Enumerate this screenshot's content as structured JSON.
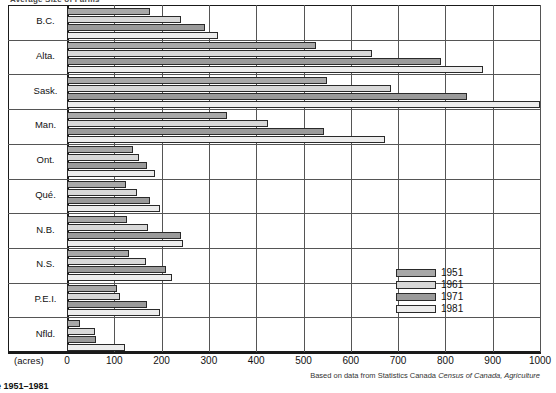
{
  "title": "Average Size of Farms",
  "bottom_caption": "e 1951–1981",
  "source_note_prefix": "Based on data from Statistics Canada ",
  "source_note_italic": "Census of Canada, Agriculture",
  "x_units_label": "(acres)",
  "legend": {
    "items": [
      {
        "label": "1951",
        "color": "#a8a8a8"
      },
      {
        "label": "1961",
        "color": "#d8d8d8"
      },
      {
        "label": "1971",
        "color": "#9a9a9a"
      },
      {
        "label": "1981",
        "color": "#ececec"
      }
    ]
  },
  "chart_data": {
    "type": "bar",
    "orientation": "horizontal",
    "title": "Average Size of Farms",
    "xlabel": "(acres)",
    "ylabel": "",
    "xlim": [
      0,
      1000
    ],
    "xticks": [
      0,
      100,
      200,
      300,
      400,
      500,
      600,
      700,
      800,
      900,
      1000
    ],
    "grid": true,
    "legend_position": "inside-right",
    "categories": [
      "B.C.",
      "Alta.",
      "Sask.",
      "Man.",
      "Ont.",
      "Qué.",
      "N.B.",
      "N.S.",
      "P.E.I.",
      "Nfld."
    ],
    "series": [
      {
        "name": "1951",
        "color": "#a8a8a8",
        "values": [
          175,
          527,
          550,
          338,
          139,
          125,
          127,
          132,
          106,
          28
        ]
      },
      {
        "name": "1961",
        "color": "#d8d8d8",
        "values": [
          240,
          645,
          686,
          425,
          153,
          148,
          172,
          168,
          113,
          60
        ]
      },
      {
        "name": "1971",
        "color": "#9a9a9a",
        "values": [
          291,
          790,
          845,
          543,
          169,
          175,
          240,
          210,
          170,
          62
        ]
      },
      {
        "name": "1981",
        "color": "#ececec",
        "values": [
          320,
          880,
          1000,
          673,
          185,
          196,
          246,
          222,
          196,
          123
        ]
      }
    ]
  },
  "axis": {
    "tick_labels": [
      "0",
      "100",
      "200",
      "300",
      "400",
      "500",
      "600",
      "700",
      "800",
      "900",
      "1000"
    ]
  }
}
